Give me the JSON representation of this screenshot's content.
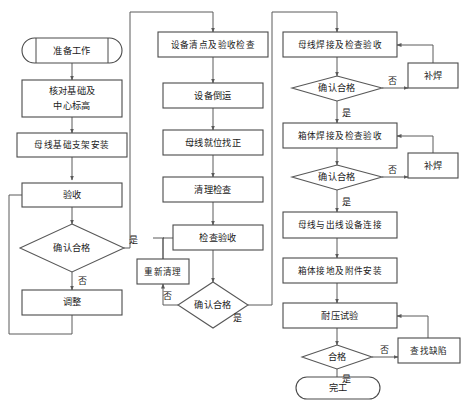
{
  "diagram": {
    "type": "flowchart",
    "background_color": "#ffffff",
    "line_color": "#5a5a5a",
    "text_color": "#1a1a1a"
  },
  "columns": {
    "column1": {
      "name": "基础准备",
      "nodes": {
        "start": {
          "label": "准备工作",
          "shape": "terminator"
        },
        "check_base": {
          "line1": "核对基础及",
          "line2": "中心标高",
          "shape": "process"
        },
        "bracket_install": {
          "label": "母线基础支架安装",
          "shape": "process"
        },
        "acceptance": {
          "label": "验收",
          "shape": "process"
        },
        "decision": {
          "label": "确认合格",
          "shape": "decision"
        },
        "adjust": {
          "label": "调整",
          "shape": "process"
        }
      },
      "edges": {
        "yes": "是",
        "no": "否"
      }
    },
    "column2": {
      "name": "设备就位",
      "nodes": {
        "inventory": {
          "label": "设备清点及验收检查",
          "shape": "process"
        },
        "transport": {
          "label": "设备倒运",
          "shape": "process"
        },
        "align": {
          "label": "母线就位找正",
          "shape": "process"
        },
        "clean_check": {
          "label": "清理检查",
          "shape": "process"
        },
        "inspect_accept": {
          "label": "检查验收",
          "shape": "process"
        },
        "decision": {
          "label": "确认合格",
          "shape": "decision"
        },
        "reclean": {
          "label": "重新清理",
          "shape": "process"
        }
      },
      "edges": {
        "yes": "是",
        "no": "否"
      }
    },
    "column3": {
      "name": "焊接与试验",
      "nodes": {
        "busbar_weld": {
          "label": "母线焊接及检查验收",
          "shape": "process"
        },
        "decision1": {
          "label": "确认合格",
          "shape": "decision"
        },
        "repair_weld1": {
          "label": "补焊",
          "shape": "process"
        },
        "case_weld": {
          "label": "箱体焊接及检查验收",
          "shape": "process"
        },
        "decision2": {
          "label": "确认合格",
          "shape": "decision"
        },
        "repair_weld2": {
          "label": "补焊",
          "shape": "process"
        },
        "outlet_connect": {
          "label": "母线与出线设备连接",
          "shape": "process"
        },
        "ground_install": {
          "label": "箱体接地及附件安装",
          "shape": "process"
        },
        "pressure_test": {
          "label": "耐压试验",
          "shape": "process"
        },
        "decision3": {
          "label": "合格",
          "shape": "decision"
        },
        "find_defect": {
          "label": "查找缺陷",
          "shape": "process"
        },
        "finish": {
          "label": "完工",
          "shape": "terminator"
        }
      },
      "edges": {
        "yes": "是",
        "no": "否"
      }
    }
  }
}
